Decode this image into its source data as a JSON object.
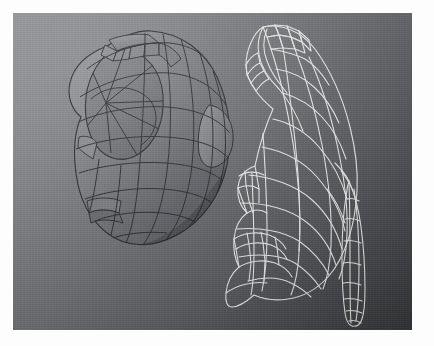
{
  "scene": {
    "app_kind": "3d-modeling-viewport",
    "render_mode_left": "shaded-with-wireframe",
    "render_mode_right": "wireframe-only",
    "object_count": 2,
    "background_top_left_color": "#949598",
    "background_bottom_right_color": "#36383b",
    "canvas": {
      "x": 13,
      "y": 13,
      "width": 399,
      "height": 317
    },
    "page_border_color": "#fdfdfd"
  },
  "models": [
    {
      "name": "shaded-organic-shell",
      "label": "Shaded model",
      "position": "left",
      "surface_fill_light": "#8a8b8f",
      "surface_fill_dark": "#55565a",
      "wire_color": "#2e2f32",
      "wire_width": 1.0,
      "bbox": {
        "x": 60,
        "y": 18,
        "width": 160,
        "height": 210
      },
      "features": [
        "domed-cap",
        "concave-disc-face",
        "ridged-collar-tabs",
        "lower-notch",
        "bulge-lobe-right"
      ]
    },
    {
      "name": "wireframe-organic-shell",
      "label": "Wireframe model",
      "position": "right",
      "wire_color": "#e4e5e3",
      "wire_width": 1.1,
      "bbox": {
        "x": 232,
        "y": 22,
        "width": 150,
        "height": 296
      },
      "features": [
        "hooked-upper-arm",
        "quad-grid-body",
        "left-notch-flange",
        "lower-mouth-cavity",
        "long-tapered-tail"
      ]
    }
  ],
  "left_model_geometry": {
    "outline": "M150 22 C 176 26 196 44 206 70 C 216 96 218 126 210 152 C 202 180 184 204 158 218 C 134 230 110 230 94 218 C 76 204 66 182 64 158 C 62 136 64 118 70 104 C 62 96 58 84 60 72 C 62 56 74 44 90 38 C 106 30 128 20 150 22 Z",
    "longitudinal_lines": 7,
    "latitudinal_lines": 8,
    "disc_spokes": 8
  },
  "right_model_geometry": {
    "outline": "M268 24 C 290 22 312 34 326 56 C 342 82 350 112 352 140 C 354 166 350 188 344 206 C 338 226 330 246 318 258 C 304 272 286 278 268 276 C 258 286 250 292 244 294 C 240 292 238 286 238 278 C 238 266 242 254 248 246 C 244 238 240 228 240 216 C 240 204 244 194 250 188 C 244 182 240 172 240 162 C 240 150 246 142 254 138 C 260 120 266 100 274 84 C 268 76 262 70 258 64 C 252 58 248 52 246 44 C 244 34 252 26 268 24 Z",
    "grid_columns": 6,
    "grid_rows": 11,
    "tail_segments": 9
  },
  "a11y": {
    "title": "3D modeling viewport: shaded organic shell model beside its wireframe",
    "left_caption": "Shaded model",
    "right_caption": "Wireframe model"
  }
}
